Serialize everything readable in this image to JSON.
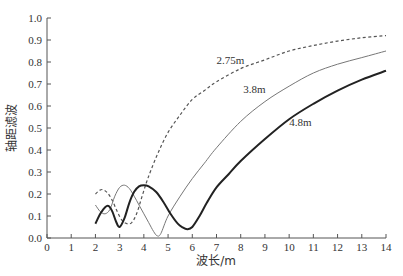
{
  "chart_data": {
    "type": "line",
    "title": "",
    "xlabel": "波长/m",
    "ylabel": "轴距滤波",
    "xlim": [
      0,
      14
    ],
    "ylim": [
      0.0,
      1.0
    ],
    "xticks": [
      "0",
      "1",
      "2",
      "3",
      "4",
      "5",
      "6",
      "7",
      "8",
      "9",
      "10",
      "11",
      "12",
      "13",
      "14"
    ],
    "yticks": [
      "0.0",
      "0.1",
      "0.2",
      "0.3",
      "0.4",
      "0.5",
      "0.6",
      "0.7",
      "0.8",
      "0.9",
      "1.0"
    ],
    "grid": false,
    "legend": "inline labels",
    "series": [
      {
        "name": "2.75m",
        "style": "dashed",
        "color": "#555555",
        "label_pos": [
          7.0,
          0.79
        ],
        "x": [
          2.0,
          2.15,
          2.3,
          2.5,
          2.7,
          2.9,
          3.1,
          3.3,
          3.5,
          3.7,
          3.9,
          4.1,
          4.3,
          4.6,
          5.0,
          5.5,
          6.0,
          6.5,
          7.0,
          8.0,
          9.0,
          10.0,
          11.0,
          12.0,
          13.0,
          14.0
        ],
        "y": [
          0.2,
          0.215,
          0.22,
          0.205,
          0.17,
          0.12,
          0.08,
          0.065,
          0.07,
          0.11,
          0.18,
          0.25,
          0.31,
          0.39,
          0.48,
          0.56,
          0.63,
          0.67,
          0.71,
          0.77,
          0.81,
          0.85,
          0.875,
          0.895,
          0.91,
          0.92
        ]
      },
      {
        "name": "3.8m",
        "style": "solid-thin",
        "color": "#777777",
        "label_pos": [
          8.1,
          0.66
        ],
        "x": [
          2.0,
          2.2,
          2.4,
          2.6,
          2.8,
          3.0,
          3.2,
          3.4,
          3.6,
          3.8,
          4.0,
          4.2,
          4.4,
          4.55,
          4.7,
          5.0,
          5.5,
          6.0,
          6.5,
          7.0,
          8.0,
          9.0,
          10.0,
          11.0,
          12.0,
          13.0,
          14.0
        ],
        "y": [
          0.15,
          0.12,
          0.11,
          0.13,
          0.19,
          0.23,
          0.24,
          0.225,
          0.19,
          0.15,
          0.11,
          0.07,
          0.03,
          0.01,
          0.02,
          0.1,
          0.19,
          0.27,
          0.34,
          0.41,
          0.53,
          0.62,
          0.69,
          0.75,
          0.79,
          0.82,
          0.85
        ]
      },
      {
        "name": "4.8m",
        "style": "solid-thick",
        "color": "#222222",
        "label_pos": [
          10.0,
          0.51
        ],
        "x": [
          2.0,
          2.2,
          2.4,
          2.55,
          2.7,
          2.85,
          3.0,
          3.2,
          3.4,
          3.6,
          3.8,
          4.0,
          4.2,
          4.5,
          4.8,
          5.1,
          5.4,
          5.6,
          5.8,
          6.0,
          6.3,
          6.6,
          7.0,
          7.5,
          8.0,
          9.0,
          10.0,
          11.0,
          12.0,
          13.0,
          14.0
        ],
        "y": [
          0.065,
          0.11,
          0.14,
          0.145,
          0.12,
          0.075,
          0.05,
          0.09,
          0.16,
          0.21,
          0.235,
          0.24,
          0.235,
          0.21,
          0.165,
          0.11,
          0.065,
          0.048,
          0.04,
          0.05,
          0.1,
          0.16,
          0.23,
          0.29,
          0.35,
          0.45,
          0.54,
          0.61,
          0.67,
          0.72,
          0.76
        ]
      }
    ]
  }
}
